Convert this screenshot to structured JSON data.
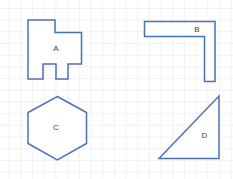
{
  "canvas": {
    "width": 233,
    "height": 179,
    "background": "#ffffff",
    "grid_color": "#f1f1f4",
    "grid_spacing_px": 11.7
  },
  "colors": {
    "shape_stroke": "#4472C4",
    "shape_fill": "#ffffff",
    "label_color": "#404040"
  },
  "shapes": [
    {
      "id": "A",
      "label": "A",
      "type": "irregular-rectilinear-polygon-with-two-bottom-notches",
      "points": "28,20 55,20 55,32.5 81.5,32.5 81.5,64 68,64 68,79 56,79 56,64 43,64 43,79 28,79"
    },
    {
      "id": "B",
      "label": "B",
      "type": "l-shape-horizontal-bar-with-right-leg",
      "points": "144.5,21.5 215,21.5 215,81.5 204.5,81.5 204.5,36.5 144.5,36.5"
    },
    {
      "id": "C",
      "label": "C",
      "type": "hexagon",
      "points": "57.3,96.5 86.5,112.5 86.5,143.5 57.3,160 28,143.5 28,112.5"
    },
    {
      "id": "D",
      "label": "D",
      "type": "right-triangle",
      "points": "159,158.5 219,158.5 219,96"
    }
  ]
}
